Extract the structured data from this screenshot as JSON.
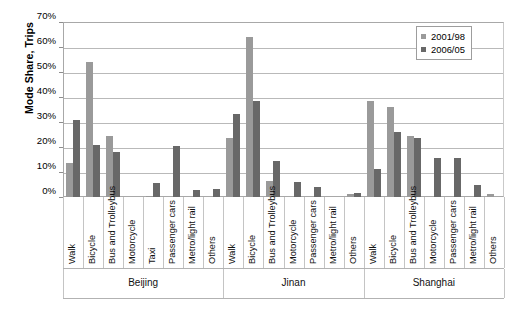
{
  "chart_data": {
    "type": "bar",
    "title": "",
    "xlabel": "",
    "ylabel": "Mode Share, Trips",
    "ylim": [
      0,
      70
    ],
    "ytick_labels": [
      "0%",
      "10%",
      "20%",
      "30%",
      "40%",
      "50%",
      "60%",
      "70%"
    ],
    "ytick_values": [
      0,
      10,
      20,
      30,
      40,
      50,
      60,
      70
    ],
    "grid": true,
    "legend_position": "top-right",
    "legend": [
      "2001/98",
      "2006/05"
    ],
    "series": [
      {
        "name": "2001/98",
        "color": "#9a9a9a"
      },
      {
        "name": "2006/05",
        "color": "#686868"
      }
    ],
    "groups": [
      {
        "name": "Beijing",
        "categories": [
          "Walk",
          "Bicycle",
          "Bus and Trolleybus",
          "Motorcycle",
          "Taxi",
          "Passenger cars",
          "Metro/light rail",
          "Others"
        ],
        "values_2001_98": [
          13.8,
          54.0,
          24.5,
          0.0,
          0.5,
          0.0,
          0.0,
          0.0
        ],
        "values_2006_05": [
          31.0,
          20.9,
          18.1,
          0.0,
          5.6,
          20.6,
          2.8,
          3.4
        ]
      },
      {
        "name": "Jinan",
        "categories": [
          "Walk",
          "Bicycle",
          "Bus and Trolleybus",
          "Motorcycle",
          "Passenger cars",
          "Metro/light rail",
          "Others"
        ],
        "values_2001_98": [
          23.6,
          64.0,
          6.6,
          0.0,
          0.0,
          0.0,
          1.2
        ],
        "values_2006_05": [
          33.1,
          38.4,
          14.5,
          6.1,
          4.2,
          0.0,
          1.7
        ]
      },
      {
        "name": "Shanghai",
        "categories": [
          "Walk",
          "Bicycle",
          "Bus and Trolleybus",
          "Motorcycle",
          "Passenger cars",
          "Metro/light rail",
          "Others"
        ],
        "values_2001_98": [
          38.6,
          35.9,
          24.3,
          0.0,
          0.0,
          0.0,
          1.3
        ],
        "values_2006_05": [
          11.1,
          25.9,
          23.6,
          15.8,
          15.5,
          4.7,
          0.0
        ]
      }
    ]
  },
  "colors": {
    "series_2001_98": "#9a9a9a",
    "series_2006_05": "#686868",
    "gridline": "#b9b9b9",
    "axis": "#a8a8a8",
    "background": "#ffffff"
  }
}
